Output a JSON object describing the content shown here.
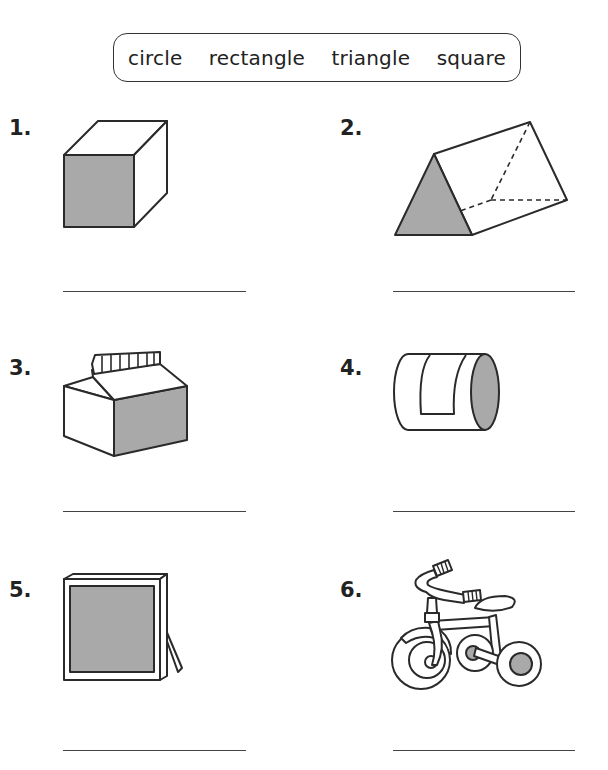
{
  "word_bank": {
    "words": [
      "circle",
      "rectangle",
      "triangle",
      "square"
    ]
  },
  "colors": {
    "outline": "#2a2a2a",
    "shade": "#a9a9a9",
    "background": "#ffffff"
  },
  "items": [
    {
      "number": "1.",
      "figure": "cube",
      "shaded_face": "square",
      "answer": ""
    },
    {
      "number": "2.",
      "figure": "triangular-prism",
      "shaded_face": "triangle",
      "answer": ""
    },
    {
      "number": "3.",
      "figure": "milk-carton",
      "shaded_face": "rectangle",
      "answer": ""
    },
    {
      "number": "4.",
      "figure": "cylinder-can",
      "shaded_face": "circle",
      "answer": ""
    },
    {
      "number": "5.",
      "figure": "picture-frame",
      "shaded_face": "square",
      "answer": ""
    },
    {
      "number": "6.",
      "figure": "tricycle",
      "shaded_face": "circle",
      "answer": ""
    }
  ]
}
